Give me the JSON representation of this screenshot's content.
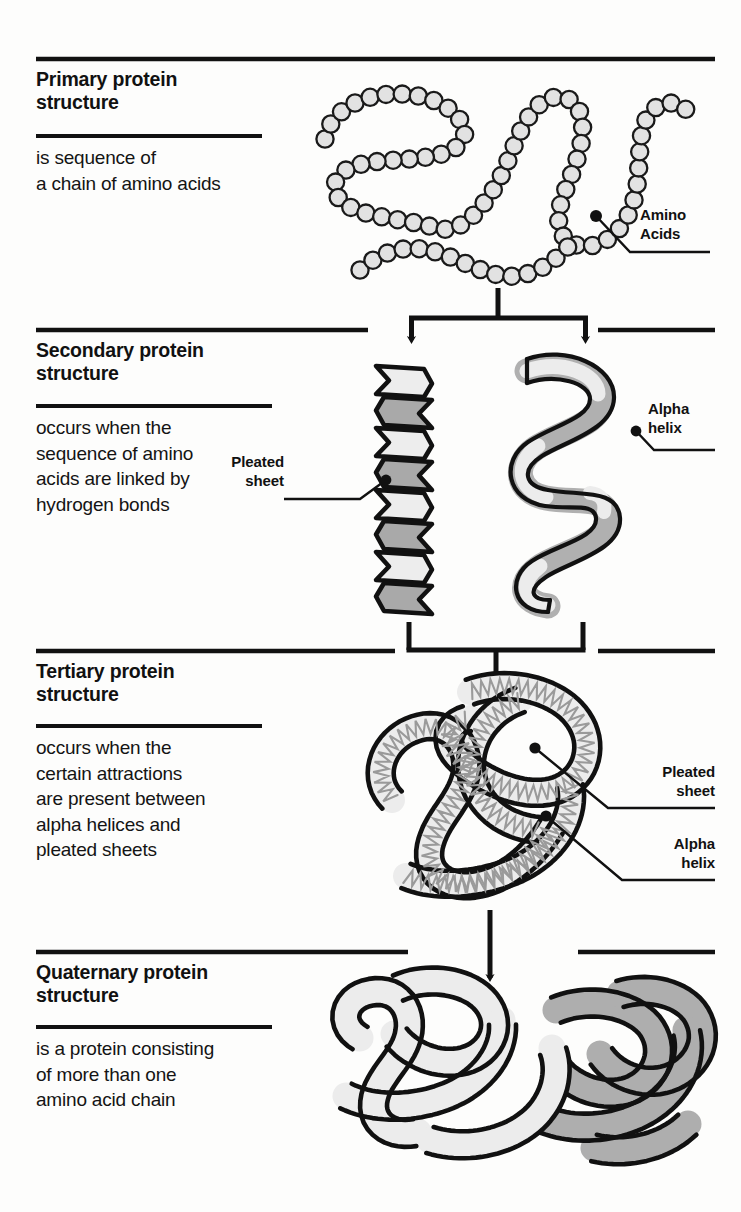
{
  "diagram": {
    "background_color": "#fdfdfc",
    "ink_color": "#111111",
    "bead_fill": "#e2e2e2",
    "ribbon_light": "#e8e8e8",
    "ribbon_dark": "#a8a8a8"
  },
  "sections": [
    {
      "id": "primary",
      "heading": "Primary protein\nstructure",
      "body": "is sequence of\na chain of amino acids",
      "figure": "bead-chain"
    },
    {
      "id": "secondary",
      "heading": "Secondary protein\nstructure",
      "body": "occurs when the\nsequence of amino\nacids are linked by\nhydrogen bonds",
      "figure": "pleated-sheet-and-alpha-helix"
    },
    {
      "id": "tertiary",
      "heading": "Tertiary protein\nstructure",
      "body": "occurs when the\ncertain attractions\nare present between\nalpha helices and\npleated sheets",
      "figure": "folded-single-chain"
    },
    {
      "id": "quaternary",
      "heading": "Quaternary protein\nstructure",
      "body": "is a protein consisting\nof more than one\namino acid chain",
      "figure": "multi-chain-assembly"
    }
  ],
  "callouts": [
    {
      "id": "amino-acids",
      "label": "Amino\nAcids",
      "target": "primary"
    },
    {
      "id": "pleated-sheet-secondary",
      "label": "Pleated\nsheet",
      "target": "secondary"
    },
    {
      "id": "alpha-helix-secondary",
      "label": "Alpha\nhelix",
      "target": "secondary"
    },
    {
      "id": "pleated-sheet-tertiary",
      "label": "Pleated\nsheet",
      "target": "tertiary"
    },
    {
      "id": "alpha-helix-tertiary",
      "label": "Alpha\nhelix",
      "target": "tertiary"
    }
  ],
  "flow": [
    {
      "from": "primary",
      "to": "secondary",
      "type": "fork",
      "branches": 2
    },
    {
      "from": "secondary",
      "to": "tertiary",
      "type": "merge",
      "branches": 2
    },
    {
      "from": "tertiary",
      "to": "quaternary",
      "type": "straight",
      "branches": 1
    }
  ]
}
